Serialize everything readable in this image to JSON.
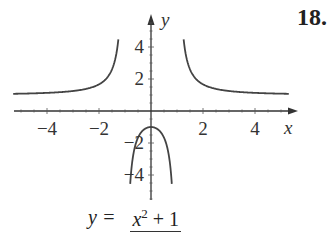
{
  "problem_number": "18.",
  "formula": {
    "lhs": "y =",
    "numerator_var": "x",
    "numerator_exp": "2",
    "numerator_rest": " + 1",
    "denominator": "x² − 1"
  },
  "chart_data": {
    "type": "line",
    "title": "",
    "function": "y = (x^2 + 1)/(x^2 - 1)",
    "xlabel": "x",
    "ylabel": "y",
    "xlim": [
      -5.2,
      5.2
    ],
    "ylim": [
      -5,
      5
    ],
    "x_ticks": [
      -4,
      -2,
      2,
      4
    ],
    "y_ticks": [
      4,
      2,
      -2,
      -4
    ],
    "vertical_asymptotes": [
      -1,
      1
    ],
    "horizontal_asymptote": 1,
    "grid": false,
    "legend": null,
    "series": [
      {
        "name": "left branch",
        "x": [
          -5,
          -4,
          -3,
          -2,
          -1.5,
          -1.25
        ],
        "y": [
          1.08,
          1.13,
          1.25,
          1.67,
          2.6,
          4.56
        ]
      },
      {
        "name": "middle branch",
        "x": [
          -0.8,
          -0.5,
          0,
          0.5,
          0.8
        ],
        "y": [
          -4.56,
          -1.67,
          -1,
          -1.67,
          -4.56
        ]
      },
      {
        "name": "right branch",
        "x": [
          1.25,
          1.5,
          2,
          3,
          4,
          5
        ],
        "y": [
          4.56,
          2.6,
          1.67,
          1.25,
          1.13,
          1.08
        ]
      }
    ]
  }
}
